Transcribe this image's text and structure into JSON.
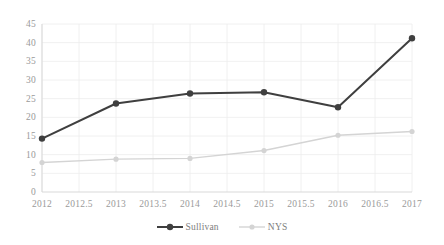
{
  "chart_data": {
    "type": "line",
    "title": "",
    "subtitle": "",
    "xlabel": "",
    "ylabel": "",
    "x": [
      2012,
      2013,
      2014,
      2015,
      2016,
      2017
    ],
    "xlim": [
      2012,
      2017
    ],
    "ylim": [
      0,
      45
    ],
    "grid": true,
    "legend_position": "bottom",
    "xtick_labels": [
      "2012",
      "2012.5",
      "2013",
      "2013.5",
      "2014",
      "2014.5",
      "2015",
      "2015.5",
      "2016",
      "2016.5",
      "2017"
    ],
    "xtick_values": [
      2012,
      2012.5,
      2013,
      2013.5,
      2014,
      2014.5,
      2015,
      2015.5,
      2016,
      2016.5,
      2017
    ],
    "ytick_labels": [
      "0",
      "5",
      "10",
      "15",
      "20",
      "25",
      "30",
      "35",
      "40",
      "45"
    ],
    "ytick_values": [
      0,
      5,
      10,
      15,
      20,
      25,
      30,
      35,
      40,
      45
    ],
    "series": [
      {
        "name": "Sullivan",
        "color": "#3f3f3f",
        "marker": "circle-filled",
        "values": [
          14.3,
          23.7,
          26.4,
          26.7,
          22.7,
          41.2
        ]
      },
      {
        "name": "NYS",
        "color": "#d4d4d4",
        "marker": "circle-filled",
        "values": [
          7.9,
          8.8,
          9.0,
          11.1,
          15.2,
          16.2
        ]
      }
    ]
  },
  "legend": {
    "items": [
      {
        "label": "Sullivan",
        "color": "#3f3f3f"
      },
      {
        "label": "NYS",
        "color": "#d4d4d4"
      }
    ]
  },
  "axes": {
    "axis_color": "#d9d9d9",
    "grid_color": "#ececec",
    "tick_text_color": "#9a9a9a"
  }
}
